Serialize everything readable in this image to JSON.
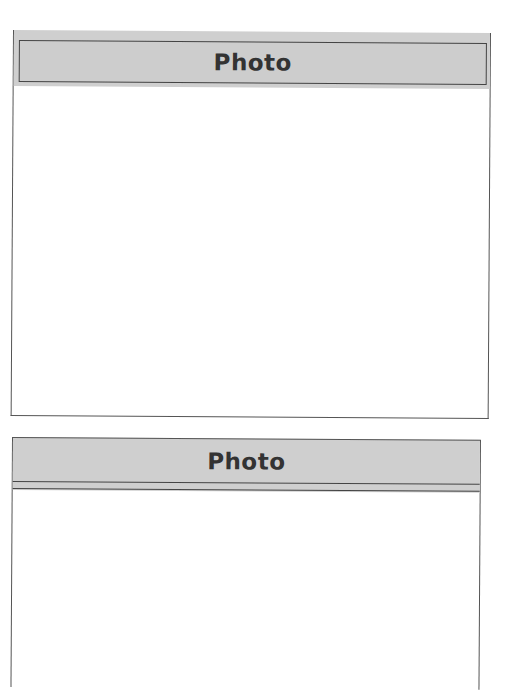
{
  "frames": [
    {
      "title": "Photo"
    },
    {
      "title": "Photo"
    }
  ]
}
